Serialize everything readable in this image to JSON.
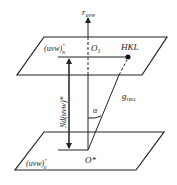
{
  "diagram": {
    "axis_label": "r",
    "axis_label_sub": "uvw",
    "upper_plane_label": "(uvw)",
    "upper_plane_sup": "*",
    "upper_plane_sub": "N",
    "origin_upper": "O",
    "origin_upper_sub": "1",
    "point_label": "HKL",
    "vector_label": "g",
    "vector_label_sub": "HKL",
    "angle_label": "α",
    "distance_label": "Nd(uvw)*",
    "origin_lower": "O*",
    "lower_plane_label": "(uvw)",
    "lower_plane_sup": "*",
    "lower_plane_sub": "0"
  }
}
